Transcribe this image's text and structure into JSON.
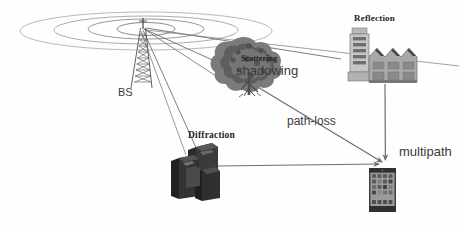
{
  "figure": {
    "background_color": "#fefefe"
  },
  "labels": {
    "base_station": "BS",
    "reflection": "Reflection",
    "scattering": "Scattering",
    "shadowing": "shadowing",
    "diffraction": "Diffraction",
    "path_loss": "path-loss",
    "multipath": "multipath"
  },
  "colors": {
    "line": "#6e6e6e",
    "line_dark": "#4a4a4a",
    "wave_ring": "#9a9a9a",
    "tower": "#555555",
    "tree_dark": "#5a5a5a",
    "tree_mid": "#7d7d7d",
    "factory_light": "#c9c9c9",
    "factory_mid": "#9d9d9d",
    "factory_dark": "#6a6a6a",
    "building_dark": "#2e2e2e",
    "building_mid": "#555555",
    "phone_body": "#4a4a4a",
    "phone_screen": "#8d8d8d",
    "text": "#2b2b2b"
  },
  "elements": {
    "base_station_tower": "lattice radio mast with antenna at apex",
    "wave_rings": "four concentric ellipses radiating from the base station antenna",
    "tree": "leafy tree representing scattering and shadowing obstacle",
    "factory": "industrial building with sawtooth roof and tower representing reflector",
    "city_buildings": "cluster of dark low-rise buildings representing diffraction edge",
    "mobile_phone": "smartphone receiver with app icon grid on screen"
  },
  "paths": [
    {
      "name": "bs-to-tree",
      "from": "base_station",
      "to": "tree",
      "arrow": false
    },
    {
      "name": "bs-to-diffraction",
      "from": "base_station",
      "to": "city_buildings",
      "arrow": false
    },
    {
      "name": "bs-to-factory",
      "from": "base_station",
      "to": "factory",
      "arrow": false
    },
    {
      "name": "tree-to-phone",
      "from": "tree",
      "to": "mobile_phone",
      "arrow": true,
      "label": "path-loss"
    },
    {
      "name": "factory-to-phone",
      "from": "factory",
      "to": "mobile_phone",
      "arrow": true
    },
    {
      "name": "diffraction-to-phone",
      "from": "city_buildings",
      "to": "mobile_phone",
      "arrow": true
    }
  ]
}
